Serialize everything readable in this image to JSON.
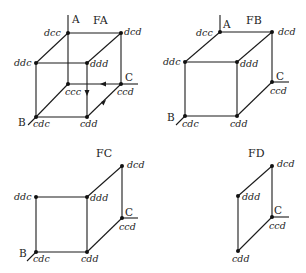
{
  "panels": [
    {
      "title": "FA",
      "axes": {
        "A": "A",
        "B": "B",
        "C": "C"
      },
      "nodes": {
        "dcc": "dcc",
        "dcd": "dcd",
        "ddc": "ddc",
        "ddd": "ddd",
        "ccc": "ccc",
        "ccd": "ccd",
        "cdc": "cdc",
        "cdd": "cdd"
      }
    },
    {
      "title": "FB",
      "axes": {
        "A": "A",
        "B": "B",
        "C": "C"
      },
      "nodes": {
        "dcc": "dcc",
        "dcd": "dcd",
        "ddc": "ddc",
        "ddd": "ddd",
        "ccd": "ccd",
        "cdc": "cdc",
        "cdd": "cdd"
      }
    },
    {
      "title": "FC",
      "axes": {
        "B": "B",
        "C": "C"
      },
      "nodes": {
        "dcd": "dcd",
        "ddc": "ddc",
        "ddd": "ddd",
        "ccd": "ccd",
        "cdc": "cdc",
        "cdd": "cdd"
      }
    },
    {
      "title": "FD",
      "axes": {
        "C": "C"
      },
      "nodes": {
        "dcd": "dcd",
        "ddd": "ddd",
        "ccd": "ccd",
        "cdd": "cdd"
      }
    }
  ]
}
